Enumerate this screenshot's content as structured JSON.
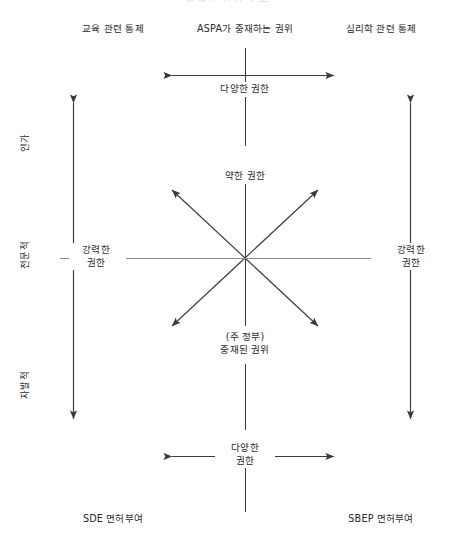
{
  "figure": {
    "clipped_top_text": "중재된 권위 구조",
    "corners": {
      "top_left": "교육 관련 통제",
      "top_center": "ASPA가 중재하는 권위",
      "top_right": "심리학 관련 통제",
      "bottom_left": "SDE 면허부여",
      "bottom_right": "SBEP 면허부여"
    },
    "axis_labels_left": [
      "인가",
      "전문적",
      "자발적"
    ],
    "arrow_labels": {
      "top_horizontal": "다양한 권한",
      "bottom_horizontal_line1": "다양한",
      "bottom_horizontal_line2": "권한",
      "left_vertical_line1": "강력한",
      "left_vertical_line2": "권한",
      "right_vertical_line1": "강력한",
      "right_vertical_line2": "권한"
    },
    "center": {
      "upper": "약한 권한",
      "lower_line1": "(주 정부)",
      "lower_line2": "중재된 권위"
    },
    "colors": {
      "ink": "#3a3a3a",
      "text": "#2a2a2a",
      "faint": "#8e8e8e",
      "background": "#ffffff"
    }
  }
}
